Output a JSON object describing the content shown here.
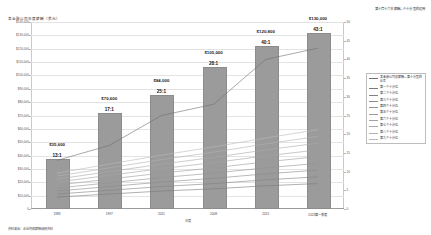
{
  "header": {
    "right_text": "第十章十六节薪酬—个十分型的运用"
  },
  "footer": {
    "note": "资料来源：企业内部薪酬调研资料"
  },
  "chart_data": {
    "type": "bar",
    "title": "某金融公司年度薪酬（美元）",
    "xlabel": "年度",
    "ylabel": "",
    "categories": [
      "1983",
      "1997",
      "2011",
      "2008",
      "2015",
      "2023第一季度"
    ],
    "values": [
      35600,
      70600,
      84000,
      105000,
      120800,
      130000
    ],
    "value_labels": [
      "$35,600",
      "$70,600",
      "$84,000",
      "$105,000",
      "$120,800",
      "$130,000"
    ],
    "ratio_labels": [
      "13:1",
      "17:1",
      "25:1",
      "28:1",
      "40:1",
      "43:1"
    ],
    "ylim": [
      0,
      140000
    ],
    "yticks": [
      0,
      10000,
      20000,
      30000,
      40000,
      50000,
      60000,
      70000,
      80000,
      90000,
      100000,
      110000,
      120000,
      130000,
      140000
    ],
    "ytick_labels": [
      "0",
      "$10,000",
      "$20,000",
      "$30,000",
      "$40,000",
      "$50,000",
      "$60,000",
      "$70,000",
      "$80,000",
      "$90,000",
      "$100,000",
      "$110,000",
      "$120,000",
      "$130,000",
      "$140,000"
    ],
    "y2lim": [
      0,
      50
    ],
    "y2ticks": [
      0,
      5,
      10,
      15,
      20,
      25,
      30,
      35,
      40,
      45,
      50
    ],
    "y2tick_labels": [
      "0",
      "5",
      "10",
      "15",
      "20",
      "25",
      "30",
      "35",
      "40",
      "45",
      "50"
    ],
    "grid": true,
    "legend_position": "right",
    "bar_color": "#9b9b9b",
    "series": [
      {
        "name": "某金融公司总薪酬—第十分型的比率",
        "color": "#6f6f6f",
        "values": [
          13,
          17,
          25,
          28,
          40,
          43
        ]
      },
      {
        "name": "第一个十分位",
        "color": "#7a7a7a",
        "values": [
          3.2,
          4.0,
          4.8,
          5.4,
          6.2,
          6.8
        ]
      },
      {
        "name": "第二个十分位",
        "color": "#828282",
        "values": [
          4.0,
          5.0,
          6.0,
          6.8,
          7.8,
          8.6
        ]
      },
      {
        "name": "第三个十分位",
        "color": "#8a8a8a",
        "values": [
          4.8,
          6.0,
          7.2,
          8.2,
          9.4,
          10.4
        ]
      },
      {
        "name": "第四个十分位",
        "color": "#929292",
        "values": [
          5.6,
          7.0,
          8.4,
          9.6,
          11.0,
          12.2
        ]
      },
      {
        "name": "第五个十分位",
        "color": "#9a9a9a",
        "values": [
          6.4,
          8.0,
          9.6,
          11.0,
          12.6,
          14.0
        ]
      },
      {
        "name": "第六个十分位",
        "color": "#a2a2a2",
        "values": [
          7.2,
          9.0,
          10.8,
          12.4,
          14.2,
          15.8
        ]
      },
      {
        "name": "第七个十分位",
        "color": "#aaaaaa",
        "values": [
          8.0,
          10.0,
          12.0,
          13.8,
          15.8,
          17.6
        ]
      },
      {
        "name": "第八个十分位",
        "color": "#b2b2b2",
        "values": [
          8.8,
          11.0,
          13.2,
          15.2,
          17.4,
          19.4
        ]
      },
      {
        "name": "第九个十分位",
        "color": "#bababa",
        "values": [
          9.6,
          12.0,
          14.4,
          16.6,
          19.0,
          21.2
        ]
      }
    ]
  }
}
